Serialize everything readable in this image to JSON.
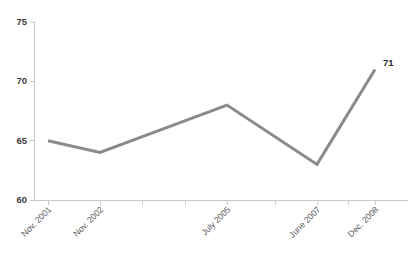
{
  "chart_data": {
    "type": "line",
    "title": "",
    "subtitle": "",
    "xlabel": "",
    "ylabel": "",
    "categories": [
      "Nov. 2001",
      "Nov. 2002",
      "July 2005",
      "June 2007",
      "Dec. 2008"
    ],
    "values": [
      65,
      64,
      68,
      63,
      71
    ],
    "series": [
      {
        "name": "",
        "values": [
          65,
          64,
          68,
          63,
          71
        ]
      }
    ],
    "point_labels": [
      "",
      "",
      "",
      "",
      "71"
    ],
    "ylim": [
      60,
      75
    ],
    "yticks": [
      60,
      65,
      70,
      75
    ],
    "ytick_labels": [
      "60",
      "65",
      "70",
      "75"
    ],
    "xtick_labels": [
      "Nov. 2001",
      "Nov. 2002",
      "July 2005",
      "June 2007",
      "Dec. 2008"
    ],
    "grid": false,
    "legend": false,
    "legend_position": "none",
    "line_color": "#8a8a8a",
    "axis_color": "#c9c9c9",
    "text_color": "#3c3c3c",
    "background_color": "#ffffff",
    "x_positions": [
      48,
      100,
      227,
      317,
      375
    ],
    "extra_tick_positions": [
      48,
      100,
      142,
      185,
      227,
      275,
      317,
      348,
      375
    ]
  },
  "labels": {
    "y_60": "60",
    "y_65": "65",
    "y_70": "70",
    "y_75": "75",
    "x_0": "Nov. 2001",
    "x_1": "Nov. 2002",
    "x_2": "July 2005",
    "x_3": "June 2007",
    "x_4": "Dec. 2008",
    "final_value": "71"
  }
}
